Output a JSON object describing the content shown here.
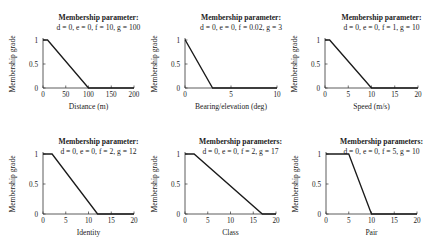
{
  "chart_data": [
    {
      "type": "line",
      "title": "Membership parameter:",
      "subtitle": "d = 0, e = 0, f = 10, g = 100",
      "xlabel": "Distance (m)",
      "ylabel": "Membership grade",
      "xlim": [
        0,
        200
      ],
      "ylim": [
        0,
        1
      ],
      "xticks": [
        0,
        50,
        100,
        150,
        200
      ],
      "yticks": [
        0,
        0.5,
        1
      ],
      "ytick_labels": [
        "0",
        "0.5",
        "1"
      ],
      "x": [
        0,
        10,
        100,
        200
      ],
      "y": [
        1,
        1,
        0,
        0
      ],
      "grid": false
    },
    {
      "type": "line",
      "title": "Membership parameter:",
      "subtitle": "d = 0, e = 0, f = 0.02, g = 3",
      "xlabel": "Bearing/elevation (deg)",
      "ylabel": "Membership grade",
      "xlim": [
        0,
        10
      ],
      "ylim": [
        0,
        1
      ],
      "xticks": [
        0,
        5,
        10
      ],
      "yticks": [
        0,
        0.5,
        1
      ],
      "ytick_labels": [
        "0",
        "0.5",
        "1"
      ],
      "x": [
        0,
        0.02,
        3,
        10
      ],
      "y": [
        1,
        1,
        0,
        0
      ],
      "grid": false
    },
    {
      "type": "line",
      "title": "Membership parameter:",
      "subtitle": "d = 0, e = 0, f = 1, g = 10",
      "xlabel": "Speed (m/s)",
      "ylabel": "Membership grade",
      "xlim": [
        0,
        20
      ],
      "ylim": [
        0,
        1
      ],
      "xticks": [
        0,
        5,
        10,
        15,
        20
      ],
      "yticks": [
        0,
        0.5,
        1
      ],
      "ytick_labels": [
        "0",
        "0.5",
        "1"
      ],
      "x": [
        0,
        1,
        10,
        20
      ],
      "y": [
        1,
        1,
        0,
        0
      ],
      "grid": false
    },
    {
      "type": "line",
      "title": "Membership parameter:",
      "subtitle": "d = 0, e = 0, f = 2, g = 12",
      "xlabel": "Identity",
      "ylabel": "Membership grade",
      "xlim": [
        0,
        20
      ],
      "ylim": [
        0,
        1
      ],
      "xticks": [
        0,
        5,
        10,
        15,
        20
      ],
      "yticks": [
        0,
        0.5,
        1
      ],
      "ytick_labels": [
        "0",
        "0.5",
        "1"
      ],
      "x": [
        0,
        2,
        12,
        20
      ],
      "y": [
        1,
        1,
        0,
        0
      ],
      "grid": false
    },
    {
      "type": "line",
      "title": "Membership parameters:",
      "subtitle": "d = 0, e = 0, f = 2, g = 17",
      "xlabel": "Class",
      "ylabel": "Membership grade",
      "xlim": [
        0,
        20
      ],
      "ylim": [
        0,
        1
      ],
      "xticks": [
        0,
        5,
        10,
        15,
        20
      ],
      "yticks": [
        0,
        0.5,
        1
      ],
      "ytick_labels": [
        "0",
        "0.5",
        "1"
      ],
      "x": [
        0,
        2,
        17,
        20
      ],
      "y": [
        1,
        1,
        0,
        0
      ],
      "grid": false
    },
    {
      "type": "line",
      "title": "Membership parameters:",
      "subtitle": "d = 0, e = 0, f = 5, g = 10",
      "xlabel": "Pair",
      "ylabel": "Membership grade",
      "xlim": [
        0,
        20
      ],
      "ylim": [
        0,
        1
      ],
      "xticks": [
        0,
        5,
        10,
        15,
        20
      ],
      "yticks": [
        0,
        0.5,
        1
      ],
      "ytick_labels": [
        "0",
        "0.5",
        "1"
      ],
      "x": [
        0,
        5,
        10,
        20
      ],
      "y": [
        1,
        1,
        0,
        0
      ],
      "grid": false
    }
  ],
  "colors": {
    "line": "#1a1a1a",
    "axis": "#333333",
    "text": "#222222",
    "background": "#ffffff"
  }
}
